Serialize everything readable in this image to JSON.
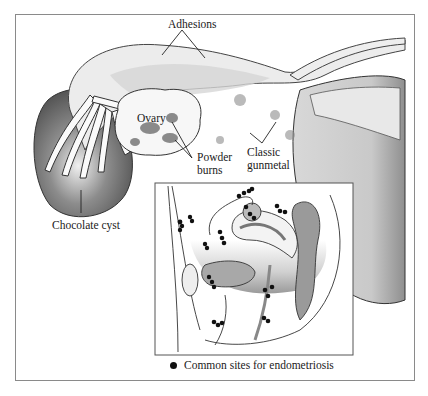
{
  "figure": {
    "labels": {
      "adhesions": "Adhesions",
      "ovary": "Ovary",
      "powder_burns_line1": "Powder",
      "powder_burns_line2": "burns",
      "classic_line1": "Classic",
      "classic_line2": "gunmetal",
      "chocolate_cyst": "Chocolate cyst"
    },
    "legend": {
      "marker": "filled-circle",
      "text": "Common sites for endometriosis"
    },
    "colors": {
      "frame": "#8a8a8a",
      "tissue_light": "#e6e6e6",
      "tissue_mid": "#bdbdbd",
      "tissue_dark": "#7a7a7a",
      "lesion": "#111111"
    }
  }
}
